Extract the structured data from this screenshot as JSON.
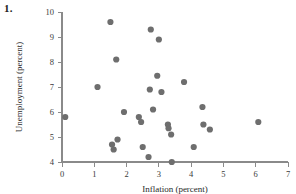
{
  "figure": {
    "label": "1."
  },
  "chart_data": {
    "type": "scatter",
    "title": "",
    "xlabel": "Inflation (percent)",
    "ylabel": "Unemployment (percent)",
    "xlim": [
      0,
      7
    ],
    "ylim": [
      4,
      10
    ],
    "xticks": [
      "0",
      "1",
      "2",
      "3",
      "4",
      "5",
      "6",
      "7"
    ],
    "yticks": [
      "4",
      "5",
      "6",
      "7",
      "8",
      "9",
      "10"
    ],
    "grid": false,
    "legend": false,
    "marker_color": "#6e6e6e",
    "marker_size": 3.1,
    "axis_color": "#8a8a8a",
    "points": [
      {
        "x": 0.1,
        "y": 5.8
      },
      {
        "x": 1.1,
        "y": 7.0
      },
      {
        "x": 1.5,
        "y": 9.6
      },
      {
        "x": 1.55,
        "y": 4.7
      },
      {
        "x": 1.6,
        "y": 4.5
      },
      {
        "x": 1.68,
        "y": 8.1
      },
      {
        "x": 1.72,
        "y": 4.9
      },
      {
        "x": 1.92,
        "y": 6.0
      },
      {
        "x": 2.38,
        "y": 5.8
      },
      {
        "x": 2.45,
        "y": 5.6
      },
      {
        "x": 2.5,
        "y": 4.6
      },
      {
        "x": 2.68,
        "y": 4.2
      },
      {
        "x": 2.72,
        "y": 6.9
      },
      {
        "x": 2.75,
        "y": 9.3
      },
      {
        "x": 2.82,
        "y": 6.1
      },
      {
        "x": 2.95,
        "y": 7.45
      },
      {
        "x": 3.0,
        "y": 8.9
      },
      {
        "x": 3.08,
        "y": 6.8
      },
      {
        "x": 3.28,
        "y": 5.5
      },
      {
        "x": 3.3,
        "y": 5.35
      },
      {
        "x": 3.38,
        "y": 5.1
      },
      {
        "x": 3.4,
        "y": 4.0
      },
      {
        "x": 3.78,
        "y": 7.2
      },
      {
        "x": 4.08,
        "y": 4.6
      },
      {
        "x": 4.35,
        "y": 6.2
      },
      {
        "x": 4.38,
        "y": 5.5
      },
      {
        "x": 4.58,
        "y": 5.3
      },
      {
        "x": 6.08,
        "y": 5.6
      }
    ]
  }
}
